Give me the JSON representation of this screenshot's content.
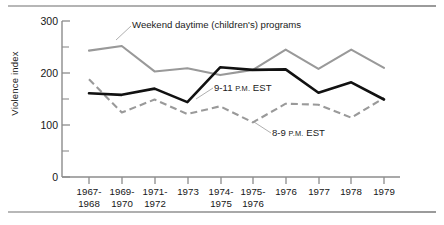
{
  "chart_data": {
    "type": "line",
    "title": "",
    "xlabel": "",
    "ylabel": "Violence index",
    "ylim": [
      0,
      300
    ],
    "yticks": [
      0,
      100,
      200,
      300
    ],
    "yticks_minor": [
      50,
      150,
      250
    ],
    "grid": false,
    "legend_position": "inline-annotations",
    "categories": [
      "1967-\n1968",
      "1969-\n1970",
      "1971-\n1972",
      "1973",
      "1974-\n1975",
      "1975-\n1976",
      "1976",
      "1977",
      "1978",
      "1979"
    ],
    "series": [
      {
        "name": "Weekend daytime (children's) programs",
        "style": "solid",
        "color": "#999999",
        "values": [
          243,
          252,
          203,
          209,
          196,
          206,
          245,
          208,
          245,
          210
        ]
      },
      {
        "name": "9-11 P.M. EST",
        "style": "solid-bold",
        "color": "#111111",
        "values": [
          161,
          158,
          170,
          144,
          211,
          206,
          207,
          162,
          182,
          149
        ]
      },
      {
        "name": "8-9 P.M. EST",
        "style": "dashed",
        "color": "#9a9a9a",
        "values": [
          188,
          124,
          149,
          121,
          136,
          105,
          141,
          139,
          114,
          152
        ]
      }
    ],
    "annotations": [
      {
        "id": "weekend",
        "text": "Weekend daytime (children's) programs",
        "target_series": "Weekend daytime (children's) programs"
      },
      {
        "id": "nine-eleven",
        "text_main": "9-11 ",
        "text_smallcaps": "P.M.",
        "text_tail": " EST",
        "target_series": "9-11 P.M. EST"
      },
      {
        "id": "eight-nine",
        "text_main": "8-9 ",
        "text_smallcaps": "P.M.",
        "text_tail": " EST",
        "target_series": "8-9 P.M. EST"
      }
    ]
  },
  "axis": {
    "y_title": "Violence index",
    "y_tick_labels": [
      "300",
      "200",
      "100",
      "0"
    ]
  },
  "colors": {
    "gray_series": "#999999",
    "black_series": "#111111",
    "dashed_series": "#9a9a9a",
    "axis": "#8c8c8c",
    "rule": "#a8a8a8"
  }
}
